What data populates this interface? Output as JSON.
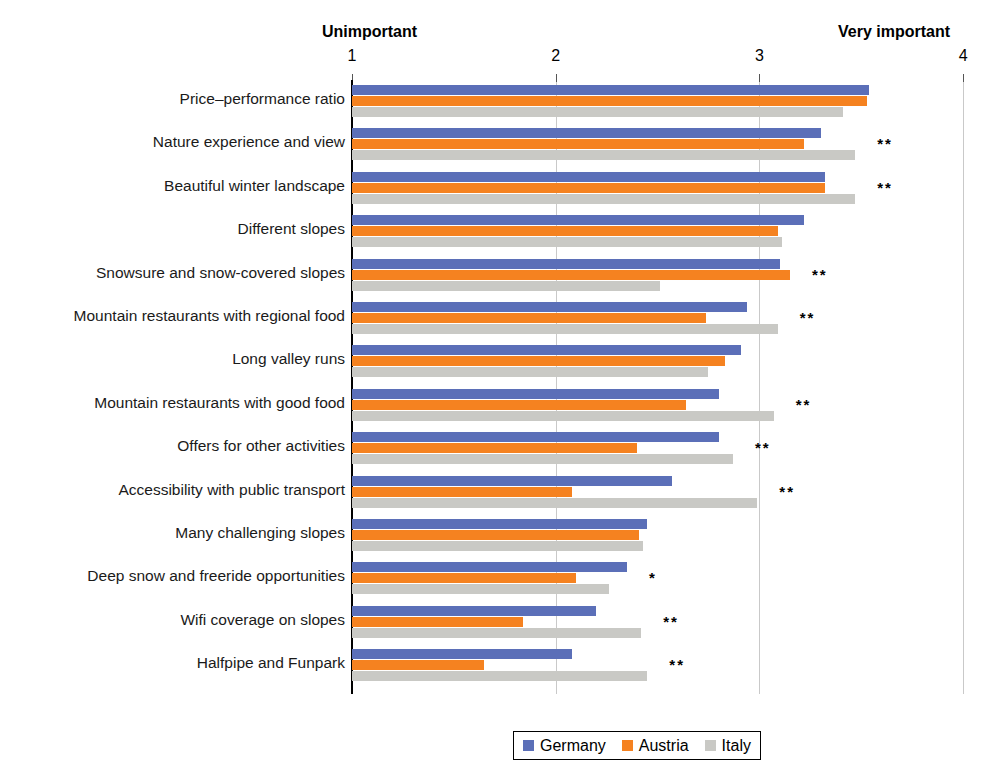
{
  "axis": {
    "left_caption": "Unimportant",
    "right_caption": "Very important",
    "ticks": [
      "1",
      "2",
      "3",
      "4"
    ]
  },
  "legend": {
    "items": [
      {
        "label": "Germany",
        "color": "#5B6FB8"
      },
      {
        "label": "Austria",
        "color": "#F58220"
      },
      {
        "label": "Italy",
        "color": "#C9C9C5"
      }
    ]
  },
  "significance": {
    "one_star": "*",
    "two_star": "**"
  },
  "chart_data": {
    "type": "bar",
    "orientation": "horizontal",
    "title": "",
    "xlabel": "",
    "ylabel": "",
    "xlim": [
      1,
      4
    ],
    "xticks": [
      1,
      2,
      3,
      4
    ],
    "grid": true,
    "legend_position": "bottom",
    "scale_anchors": {
      "low": "Unimportant",
      "high": "Very important"
    },
    "categories": [
      "Price–performance ratio",
      "Nature experience and view",
      "Beautiful winter landscape",
      "Different slopes",
      "Snowsure and snow-covered slopes",
      "Mountain restaurants with regional food",
      "Long valley runs",
      "Mountain restaurants with good food",
      "Offers for other activities",
      "Accessibility with public transport",
      "Many challenging slopes",
      "Deep snow and freeride opportunities",
      "Wifi coverage on slopes",
      "Halfpipe and Funpark"
    ],
    "series": [
      {
        "name": "Germany",
        "color": "#5B6FB8",
        "values": [
          3.54,
          3.3,
          3.32,
          3.22,
          3.1,
          2.94,
          2.91,
          2.8,
          2.8,
          2.57,
          2.45,
          2.35,
          2.2,
          2.08
        ]
      },
      {
        "name": "Austria",
        "color": "#F58220",
        "values": [
          3.53,
          3.22,
          3.32,
          3.09,
          3.15,
          2.74,
          2.83,
          2.64,
          2.4,
          2.08,
          2.41,
          2.1,
          1.84,
          1.65
        ]
      },
      {
        "name": "Italy",
        "color": "#C9C9C5",
        "values": [
          3.41,
          3.47,
          3.47,
          3.11,
          2.51,
          3.09,
          2.75,
          3.07,
          2.87,
          2.99,
          2.43,
          2.26,
          2.42,
          2.45
        ]
      }
    ],
    "annotations": [
      {
        "category_index": 0,
        "marker": ""
      },
      {
        "category_index": 1,
        "marker": "**"
      },
      {
        "category_index": 2,
        "marker": "**"
      },
      {
        "category_index": 3,
        "marker": ""
      },
      {
        "category_index": 4,
        "marker": "**"
      },
      {
        "category_index": 5,
        "marker": "**"
      },
      {
        "category_index": 6,
        "marker": ""
      },
      {
        "category_index": 7,
        "marker": "**"
      },
      {
        "category_index": 8,
        "marker": "**"
      },
      {
        "category_index": 9,
        "marker": "**"
      },
      {
        "category_index": 10,
        "marker": ""
      },
      {
        "category_index": 11,
        "marker": "*"
      },
      {
        "category_index": 12,
        "marker": "**"
      },
      {
        "category_index": 13,
        "marker": "**"
      }
    ]
  }
}
